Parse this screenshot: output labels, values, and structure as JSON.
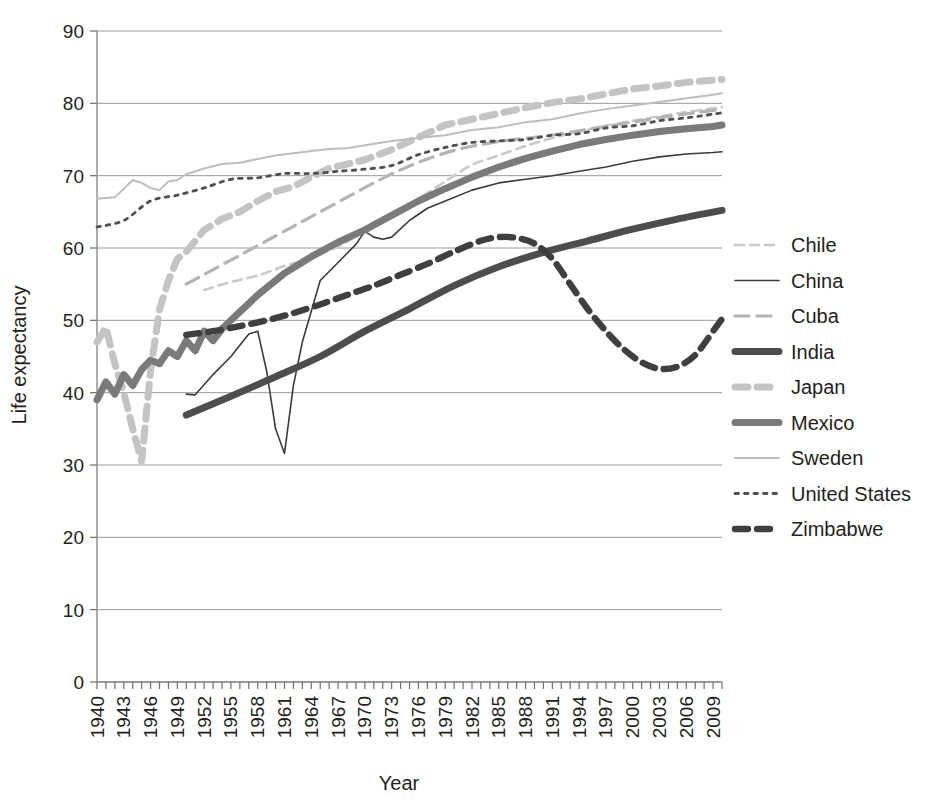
{
  "chart_data": {
    "type": "line",
    "title": "",
    "xlabel": "Year",
    "ylabel": "Life expectancy",
    "xlim": [
      1940,
      2010
    ],
    "ylim": [
      0,
      90
    ],
    "ytick_step": 10,
    "xtick_label_step": 3,
    "grid": true,
    "legend_position": "right",
    "yticks": [
      "0",
      "10",
      "20",
      "30",
      "40",
      "50",
      "60",
      "70",
      "80",
      "90"
    ],
    "xticks": [
      "1940",
      "1943",
      "1946",
      "1949",
      "1952",
      "1955",
      "1958",
      "1961",
      "1964",
      "1967",
      "1970",
      "1973",
      "1976",
      "1979",
      "1982",
      "1985",
      "1988",
      "1991",
      "1994",
      "1997",
      "2000",
      "2003",
      "2006",
      "2009"
    ],
    "series": [
      {
        "name": "Chile",
        "color": "#c9c9c9",
        "style": "dashed-thin",
        "stroke_width": 2.6,
        "dasharray": "9,6",
        "x": [
          1952,
          1955,
          1958,
          1961,
          1964,
          1967,
          1970,
          1973,
          1976,
          1979,
          1982,
          1985,
          1988,
          1991,
          1994,
          1997,
          2000,
          2003,
          2006,
          2009,
          2010
        ],
        "y": [
          54.2,
          55.3,
          56.2,
          57.5,
          58.6,
          60.2,
          62.3,
          64.3,
          66.8,
          69.2,
          71.5,
          72.8,
          74.1,
          75.2,
          76.1,
          76.9,
          77.6,
          78.2,
          78.8,
          79.3,
          79.5
        ]
      },
      {
        "name": "China",
        "color": "#3b3b3b",
        "style": "solid-thin",
        "stroke_width": 1.6,
        "dasharray": "none",
        "x": [
          1950,
          1951,
          1953,
          1955,
          1957,
          1958,
          1959,
          1960,
          1961,
          1962,
          1963,
          1965,
          1967,
          1969,
          1970,
          1971,
          1972,
          1973,
          1975,
          1977,
          1979,
          1982,
          1985,
          1988,
          1991,
          1994,
          1997,
          2000,
          2003,
          2006,
          2009,
          2010
        ],
        "y": [
          39.8,
          39.7,
          42.5,
          45.0,
          48.1,
          48.5,
          43.0,
          35.0,
          31.6,
          41.0,
          47.0,
          55.5,
          58.0,
          60.5,
          62.3,
          61.5,
          61.2,
          61.5,
          63.8,
          65.5,
          66.5,
          68.0,
          69.0,
          69.5,
          70.0,
          70.6,
          71.2,
          72.0,
          72.6,
          73.0,
          73.2,
          73.3
        ]
      },
      {
        "name": "Cuba",
        "color": "#b4b4b4",
        "style": "dashed-medium",
        "stroke_width": 3.2,
        "dasharray": "14,8",
        "x": [
          1950,
          1953,
          1956,
          1959,
          1962,
          1965,
          1968,
          1971,
          1974,
          1977,
          1980,
          1983,
          1986,
          1989,
          1992,
          1995,
          1998,
          2001,
          2004,
          2007,
          2010
        ],
        "y": [
          55.0,
          57.0,
          59.0,
          61.0,
          63.0,
          65.0,
          67.0,
          69.0,
          70.8,
          72.3,
          73.5,
          74.3,
          74.9,
          75.3,
          75.8,
          76.4,
          77.0,
          77.6,
          78.2,
          78.7,
          79.2
        ]
      },
      {
        "name": "India",
        "color": "#4d4d4d",
        "style": "solid-thick",
        "stroke_width": 7.0,
        "dasharray": "none",
        "x": [
          1950,
          1955,
          1960,
          1965,
          1970,
          1975,
          1980,
          1985,
          1990,
          1995,
          2000,
          2005,
          2010
        ],
        "y": [
          36.9,
          39.5,
          42.2,
          45.0,
          48.5,
          51.6,
          54.8,
          57.4,
          59.4,
          61.0,
          62.6,
          64.0,
          65.2
        ]
      },
      {
        "name": "Japan",
        "color": "#c4c4c4",
        "style": "dashed-thick",
        "stroke_width": 7.0,
        "dasharray": "13,9",
        "x": [
          1940,
          1941,
          1942,
          1943,
          1944,
          1945,
          1946,
          1947,
          1948,
          1949,
          1950,
          1952,
          1954,
          1956,
          1958,
          1960,
          1962,
          1964,
          1966,
          1968,
          1970,
          1973,
          1976,
          1979,
          1982,
          1985,
          1988,
          1991,
          1994,
          1997,
          2000,
          2003,
          2006,
          2009,
          2010
        ],
        "y": [
          47.0,
          49.0,
          44.0,
          40.0,
          35.0,
          30.5,
          43.0,
          51.5,
          55.5,
          58.5,
          59.5,
          62.5,
          64.0,
          65.0,
          66.5,
          67.8,
          68.5,
          69.8,
          71.0,
          71.6,
          72.2,
          73.6,
          75.3,
          77.0,
          77.8,
          78.6,
          79.4,
          80.1,
          80.6,
          81.3,
          82.0,
          82.4,
          82.9,
          83.2,
          83.3
        ]
      },
      {
        "name": "Mexico",
        "color": "#7a7a7a",
        "style": "solid-thick",
        "stroke_width": 7.0,
        "dasharray": "none",
        "x": [
          1940,
          1941,
          1942,
          1943,
          1944,
          1945,
          1946,
          1947,
          1948,
          1949,
          1950,
          1951,
          1952,
          1953,
          1954,
          1955,
          1958,
          1961,
          1964,
          1967,
          1970,
          1973,
          1976,
          1979,
          1982,
          1985,
          1988,
          1991,
          1994,
          1997,
          2000,
          2003,
          2006,
          2009,
          2010
        ],
        "y": [
          39.0,
          41.5,
          39.8,
          42.5,
          41.0,
          43.2,
          44.5,
          44.0,
          45.8,
          45.0,
          47.2,
          45.8,
          48.5,
          47.2,
          48.8,
          50.0,
          53.5,
          56.5,
          58.8,
          60.8,
          62.5,
          64.5,
          66.5,
          68.2,
          69.8,
          71.2,
          72.4,
          73.4,
          74.3,
          75.0,
          75.6,
          76.1,
          76.5,
          76.8,
          77.0
        ]
      },
      {
        "name": "Sweden",
        "color": "#bdbdbd",
        "style": "solid-thin",
        "stroke_width": 2.0,
        "dasharray": "none",
        "x": [
          1940,
          1942,
          1944,
          1945,
          1946,
          1947,
          1948,
          1949,
          1950,
          1952,
          1954,
          1956,
          1958,
          1960,
          1962,
          1964,
          1966,
          1968,
          1970,
          1973,
          1976,
          1979,
          1982,
          1985,
          1988,
          1991,
          1994,
          1997,
          2000,
          2003,
          2006,
          2009,
          2010
        ],
        "y": [
          66.8,
          67.0,
          69.4,
          69.0,
          68.3,
          68.0,
          69.2,
          69.4,
          70.2,
          71.0,
          71.6,
          71.8,
          72.3,
          72.8,
          73.1,
          73.4,
          73.7,
          73.8,
          74.2,
          74.8,
          75.2,
          75.6,
          76.3,
          76.7,
          77.4,
          77.8,
          78.6,
          79.2,
          79.7,
          80.2,
          80.7,
          81.2,
          81.4
        ]
      },
      {
        "name": "United States",
        "color": "#4f4f4f",
        "style": "dotted",
        "stroke_width": 2.8,
        "dasharray": "3.5,6",
        "x": [
          1940,
          1943,
          1946,
          1949,
          1952,
          1955,
          1958,
          1961,
          1964,
          1967,
          1970,
          1973,
          1976,
          1979,
          1982,
          1985,
          1988,
          1991,
          1994,
          1997,
          2000,
          2003,
          2006,
          2009,
          2010
        ],
        "y": [
          62.9,
          63.8,
          66.5,
          67.3,
          68.3,
          69.5,
          69.7,
          70.3,
          70.3,
          70.6,
          70.9,
          71.4,
          72.9,
          73.9,
          74.6,
          74.8,
          75.0,
          75.6,
          75.8,
          76.6,
          76.9,
          77.6,
          78.0,
          78.5,
          78.7
        ]
      },
      {
        "name": "Zimbabwe",
        "color": "#3f3f3f",
        "style": "dashed-thick",
        "stroke_width": 6.4,
        "dasharray": "13,9",
        "x": [
          1950,
          1953,
          1956,
          1959,
          1962,
          1965,
          1968,
          1971,
          1974,
          1977,
          1980,
          1983,
          1985,
          1987,
          1989,
          1991,
          1993,
          1995,
          1997,
          1999,
          2001,
          2003,
          2005,
          2007,
          2009,
          2010
        ],
        "y": [
          48.0,
          48.5,
          49.2,
          50.0,
          51.0,
          52.2,
          53.5,
          54.8,
          56.3,
          57.8,
          59.5,
          61.0,
          61.5,
          61.4,
          60.6,
          58.5,
          55.0,
          51.5,
          48.5,
          46.0,
          44.2,
          43.3,
          43.6,
          45.2,
          48.5,
          50.2
        ]
      }
    ]
  },
  "legend": {
    "items": [
      {
        "label": "Chile"
      },
      {
        "label": "China"
      },
      {
        "label": "Cuba"
      },
      {
        "label": "India"
      },
      {
        "label": "Japan"
      },
      {
        "label": "Mexico"
      },
      {
        "label": "Sweden"
      },
      {
        "label": "United States"
      },
      {
        "label": "Zimbabwe"
      }
    ]
  }
}
